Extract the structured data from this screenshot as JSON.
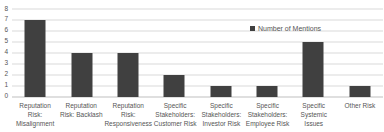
{
  "chart_data": {
    "type": "bar",
    "title": "",
    "xlabel": "",
    "ylabel": "",
    "categories": [
      "Reputation\nRisk:\nMisalignment",
      "Reputation\nRisk: Backlash",
      "Reputation\nRisk:\nResponsiveness",
      "Specific\nStakeholders:\nCustomer Risk",
      "Specific\nStakeholders:\nInvestor Risk",
      "Specific\nStakeholders:\nEmployee Risk",
      "Specific\nSystemic Issues",
      "Other Risk"
    ],
    "series": [
      {
        "name": "Number of Mentions",
        "values": [
          7,
          4,
          4,
          2,
          1,
          1,
          5,
          1
        ]
      }
    ],
    "ylim": [
      0,
      8
    ],
    "yticks": [
      0,
      1,
      2,
      3,
      4,
      5,
      6,
      7,
      8
    ],
    "grid": true,
    "legend_position": "top-right"
  },
  "colors": {
    "bar": "#404040",
    "gridline": "#d9d9d9",
    "axis_line": "#bfbfbf",
    "text": "#555555",
    "background": "#ffffff"
  }
}
